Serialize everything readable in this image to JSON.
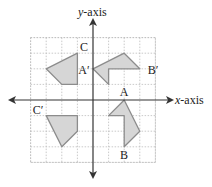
{
  "diagram": {
    "type": "coordinate-plane-transformations",
    "axes": {
      "x_label_italic": "x",
      "x_label_rest": "-axis",
      "y_label_italic": "y",
      "y_label_rest": "-axis"
    },
    "grid": {
      "min": -4,
      "max": 4
    },
    "colors": {
      "shape_fill": "#d6d6d6",
      "shape_stroke": "#8c8c8c",
      "grid": "#bdbdbd",
      "axis": "#333333"
    },
    "shapes": [
      {
        "name": "original-ABC",
        "points": [
          [
            1,
            -1
          ],
          [
            2,
            0
          ],
          [
            3,
            -2
          ],
          [
            2,
            -3
          ],
          [
            2,
            -1
          ]
        ]
      },
      {
        "name": "image-A-prime-B-prime",
        "points": [
          [
            0,
            2
          ],
          [
            2,
            3
          ],
          [
            3,
            2
          ],
          [
            1,
            2
          ],
          [
            1,
            1
          ]
        ]
      },
      {
        "name": "image-C",
        "points": [
          [
            -1,
            3
          ],
          [
            -3,
            2
          ],
          [
            -2,
            1
          ],
          [
            -1,
            1
          ]
        ]
      },
      {
        "name": "image-C-prime",
        "points": [
          [
            -3,
            -1
          ],
          [
            -1,
            -1
          ],
          [
            -1,
            -2
          ],
          [
            -2,
            -3
          ]
        ]
      }
    ],
    "labels": [
      {
        "text": "A",
        "x": 124,
        "y": 96
      },
      {
        "text": "B",
        "x": 124,
        "y": 159
      },
      {
        "text": "C",
        "x": 84,
        "y": 51
      },
      {
        "text": "A′",
        "x": 84,
        "y": 74
      },
      {
        "text": "B′",
        "x": 153,
        "y": 74
      },
      {
        "text": "C′",
        "x": 38,
        "y": 114
      }
    ]
  }
}
